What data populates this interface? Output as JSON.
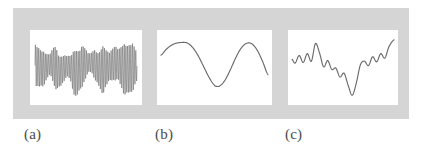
{
  "figure": {
    "background_color": "#ffffff",
    "band_color": "#d5d5d5",
    "panel_color": "#ffffff",
    "trace_color": "#6a6a6a",
    "captions": [
      {
        "key": "a",
        "label": "(a)"
      },
      {
        "key": "b",
        "label": "(b)"
      },
      {
        "key": "c",
        "label": "(c)"
      }
    ]
  },
  "chart_data": [
    {
      "id": "panel-a",
      "type": "line",
      "title": "",
      "xlabel": "",
      "ylabel": "",
      "caption": "(a)",
      "description": "Dense high-frequency oscillatory signal with varying amplitude envelope",
      "xlim": [
        0,
        1
      ],
      "ylim": [
        -1,
        1
      ],
      "grid": false,
      "legend": null,
      "samples": 520,
      "envelope_x": [
        0.0,
        0.05,
        0.1,
        0.15,
        0.2,
        0.25,
        0.3,
        0.35,
        0.4,
        0.45,
        0.5,
        0.55,
        0.6,
        0.65,
        0.7,
        0.75,
        0.8,
        0.85,
        0.9,
        0.95,
        1.0
      ],
      "envelope_y": [
        0.62,
        0.74,
        0.55,
        0.48,
        0.66,
        0.52,
        0.4,
        0.58,
        0.84,
        0.7,
        0.46,
        0.38,
        0.62,
        0.78,
        0.6,
        0.5,
        0.68,
        0.8,
        0.92,
        0.74,
        0.56
      ],
      "carrier_cycles": 62,
      "offset_x": [
        0.0,
        0.08,
        0.16,
        0.24,
        0.32,
        0.4,
        0.48,
        0.56,
        0.64,
        0.72,
        0.8,
        0.88,
        1.0
      ],
      "offset_y": [
        0.06,
        -0.04,
        0.1,
        -0.12,
        0.04,
        -0.18,
        0.08,
        0.14,
        -0.08,
        0.02,
        0.12,
        -0.06,
        0.04
      ]
    },
    {
      "id": "panel-b",
      "type": "line",
      "title": "",
      "xlabel": "",
      "ylabel": "",
      "caption": "(b)",
      "description": "Smooth sinusoid, approximately 1.5 cycles, low frequency",
      "xlim": [
        0,
        1
      ],
      "ylim": [
        -1,
        1
      ],
      "grid": false,
      "legend": null,
      "x": [
        0.0,
        0.05,
        0.1,
        0.15,
        0.2,
        0.22,
        0.25,
        0.3,
        0.35,
        0.4,
        0.45,
        0.5,
        0.52,
        0.55,
        0.6,
        0.65,
        0.7,
        0.75,
        0.8,
        0.85,
        0.9,
        0.95,
        1.0
      ],
      "y": [
        0.42,
        0.62,
        0.76,
        0.83,
        0.85,
        0.85,
        0.82,
        0.66,
        0.38,
        0.02,
        -0.34,
        -0.6,
        -0.64,
        -0.62,
        -0.42,
        -0.06,
        0.34,
        0.66,
        0.82,
        0.8,
        0.58,
        0.2,
        -0.24
      ]
    },
    {
      "id": "panel-c",
      "type": "line",
      "title": "",
      "xlabel": "",
      "ylabel": "",
      "caption": "(c)",
      "description": "Irregular smooth curve with multiple local peaks, a deep central trough and a rising tail",
      "xlim": [
        0,
        1
      ],
      "ylim": [
        -1,
        1
      ],
      "grid": false,
      "legend": null,
      "x": [
        0.0,
        0.03,
        0.07,
        0.11,
        0.15,
        0.19,
        0.23,
        0.27,
        0.31,
        0.35,
        0.39,
        0.43,
        0.47,
        0.51,
        0.55,
        0.59,
        0.63,
        0.67,
        0.71,
        0.75,
        0.79,
        0.83,
        0.87,
        0.91,
        0.95,
        1.0
      ],
      "y": [
        0.26,
        0.14,
        0.38,
        0.16,
        0.44,
        0.2,
        0.76,
        0.46,
        0.02,
        0.22,
        -0.06,
        -0.02,
        -0.3,
        -0.18,
        -0.56,
        -0.88,
        -0.5,
        0.08,
        0.2,
        0.06,
        0.34,
        0.18,
        0.44,
        0.3,
        0.66,
        0.88
      ]
    }
  ]
}
